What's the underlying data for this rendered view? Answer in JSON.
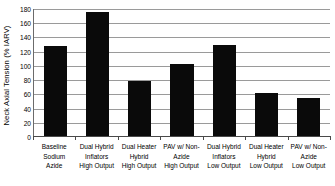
{
  "chart_data": {
    "type": "bar",
    "title": "",
    "xlabel": "",
    "ylabel": "Neck Axial Tension (% IARV)",
    "ylim": [
      0,
      180
    ],
    "ytick_step": 20,
    "grid": true,
    "legend": "none",
    "bar_color": "#0a0a0a",
    "categories": [
      "Baseline Sodium Azide",
      "Dual Hybrid Inflators High Output",
      "Dual Heater Hybrid High Output",
      "PAV w/ Non-Azide High Output",
      "Dual Hybrid Inflators Low Output",
      "Dual Heater Hybrid Low Output",
      "PAV w/ Non-Azide Low Output"
    ],
    "category_lines": [
      [
        "Baseline",
        "Sodium",
        "Azide"
      ],
      [
        "Dual Hybrid",
        "Inflators",
        "High Output"
      ],
      [
        "Dual Heater",
        "Hybrid",
        "High Output"
      ],
      [
        "PAV w/ Non-",
        "Azide",
        "High Output"
      ],
      [
        "Dual Hybrid",
        "Inflators",
        "Low Output"
      ],
      [
        "Dual Heater",
        "Hybrid",
        "Low Output"
      ],
      [
        "PAV w/ Non-",
        "Azide",
        "Low Output"
      ]
    ],
    "values": [
      127,
      175,
      78,
      101,
      128,
      61,
      54
    ],
    "ytick_labels": [
      "180",
      "160",
      "140",
      "120",
      "100",
      "80",
      "60",
      "40",
      "20",
      "0"
    ],
    "ytick_values": [
      180,
      160,
      140,
      120,
      100,
      80,
      60,
      40,
      20,
      0
    ]
  }
}
